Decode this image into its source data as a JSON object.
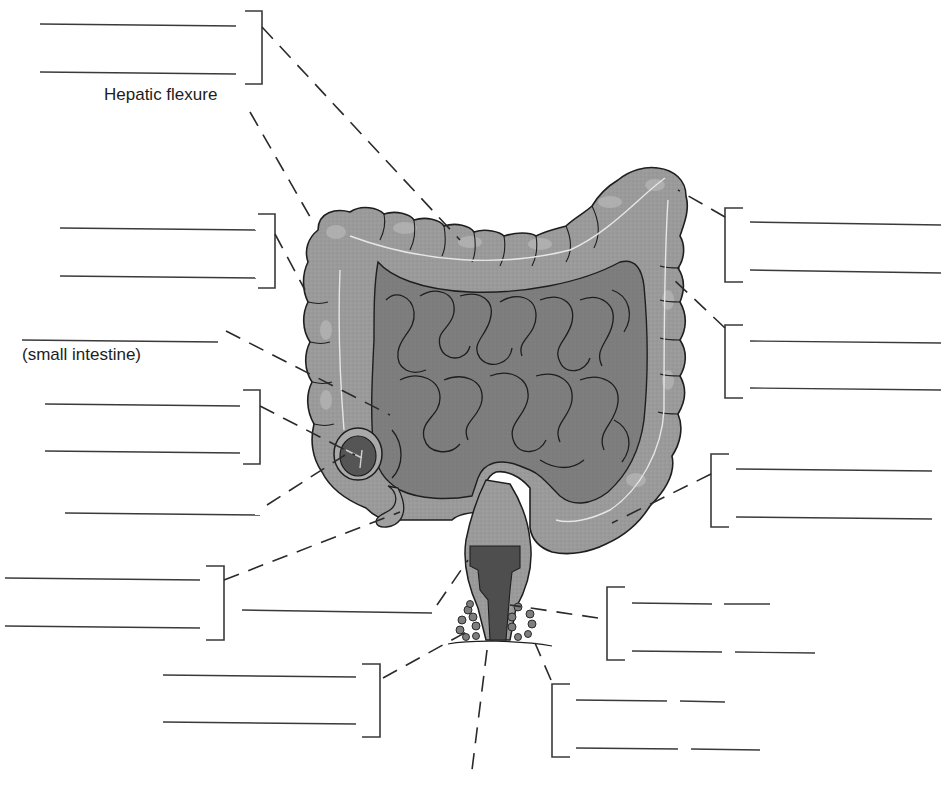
{
  "diagram": {
    "colors": {
      "organ_fill": "#9a9a9a",
      "organ_light": "#b4b4b4",
      "organ_dark": "#7a7a7a",
      "small_intestine_fill": "#8c8c8c",
      "lumen_dark": "#4e4e4e",
      "outline": "#1e1e1e",
      "blank_line": "#3a3a3a",
      "leader_line": "#2a2a2a",
      "taenia_line": "#e6e6e6"
    },
    "printed_labels": [
      {
        "id": "hepatic-flexure",
        "text": "Hepatic flexure",
        "x": 104,
        "y": 95
      },
      {
        "id": "small-intestine",
        "text": "(small intestine)",
        "x": 22,
        "y": 344
      }
    ],
    "blank_groups": [
      {
        "id": "blank-group-transverse-colon",
        "side": "left",
        "lines": [
          [
            40,
            24,
            236,
            26
          ],
          [
            40,
            72,
            236,
            74
          ]
        ],
        "bracket": {
          "x": 262,
          "top": 11,
          "bottom": 84,
          "arm": 17
        },
        "leader": [
          262,
          27,
          460,
          240
        ]
      },
      {
        "id": "blank-group-ascending-colon",
        "side": "left",
        "lines": [
          [
            60,
            228,
            256,
            230
          ],
          [
            60,
            276,
            256,
            278
          ]
        ],
        "bracket": {
          "x": 275,
          "top": 214,
          "bottom": 288,
          "arm": 17
        },
        "leader": [
          275,
          234,
          305,
          290
        ]
      },
      {
        "id": "blank-group-small-intestine",
        "side": "left",
        "lines": [
          [
            22,
            340,
            218,
            342
          ]
        ],
        "bracket": null,
        "leader": [
          226,
          331,
          390,
          415
        ]
      },
      {
        "id": "blank-group-ileocecal",
        "side": "left",
        "lines": [
          [
            45,
            404,
            240,
            406
          ],
          [
            45,
            451,
            240,
            453
          ]
        ],
        "bracket": {
          "x": 260,
          "top": 390,
          "bottom": 464,
          "arm": 17
        },
        "leader": [
          260,
          406,
          355,
          455
        ]
      },
      {
        "id": "blank-group-cecum",
        "side": "left",
        "lines": [
          [
            65,
            513,
            260,
            515
          ]
        ],
        "bracket": null,
        "leader": [
          267,
          505,
          345,
          455
        ]
      },
      {
        "id": "blank-group-appendix",
        "side": "left",
        "lines": [
          [
            5,
            578,
            200,
            580
          ],
          [
            5,
            626,
            200,
            628
          ]
        ],
        "bracket": {
          "x": 224,
          "top": 566,
          "bottom": 640,
          "arm": 18
        },
        "leader": [
          224,
          580,
          400,
          512
        ]
      },
      {
        "id": "blank-group-anal-canal",
        "side": "left",
        "lines": [
          [
            242,
            610,
            432,
            613
          ]
        ],
        "bracket": null,
        "leader": [
          437,
          605,
          468,
          560
        ]
      },
      {
        "id": "blank-group-anus",
        "side": "left",
        "lines": [
          [
            163,
            675,
            356,
            677
          ],
          [
            163,
            722,
            356,
            724
          ]
        ],
        "bracket": {
          "x": 380,
          "top": 664,
          "bottom": 737,
          "arm": 18
        },
        "leader": [
          383,
          678,
          470,
          630
        ]
      },
      {
        "id": "blank-group-splenic-flexure",
        "side": "right",
        "lines": [
          [
            750,
            222,
            941,
            225
          ],
          [
            750,
            270,
            941,
            273
          ]
        ],
        "bracket": {
          "x": 725,
          "top": 208,
          "bottom": 282,
          "arm": 18
        },
        "leader": [
          725,
          217,
          678,
          190
        ]
      },
      {
        "id": "blank-group-descending-colon",
        "side": "right",
        "lines": [
          [
            750,
            341,
            941,
            343
          ],
          [
            750,
            388,
            941,
            390
          ]
        ],
        "bracket": {
          "x": 725,
          "top": 325,
          "bottom": 398,
          "arm": 18
        },
        "leader": [
          725,
          328,
          672,
          278
        ]
      },
      {
        "id": "blank-group-sigmoid-colon",
        "side": "right",
        "lines": [
          [
            736,
            469,
            932,
            471
          ],
          [
            736,
            517,
            932,
            519
          ]
        ],
        "bracket": {
          "x": 711,
          "top": 454,
          "bottom": 527,
          "arm": 18
        },
        "leader": [
          711,
          474,
          612,
          523
        ]
      },
      {
        "id": "blank-group-sphincter-internal",
        "side": "right",
        "lines": [
          [
            632,
            603,
            712,
            604
          ],
          [
            724,
            604,
            770,
            604
          ],
          [
            632,
            651,
            722,
            652
          ],
          [
            735,
            652,
            815,
            653
          ]
        ],
        "bracket": {
          "x": 607,
          "top": 587,
          "bottom": 660,
          "arm": 18
        },
        "leader": [
          598,
          618,
          510,
          605
        ]
      },
      {
        "id": "blank-group-sphincter-external",
        "side": "right",
        "lines": [
          [
            576,
            700,
            667,
            701
          ],
          [
            680,
            701,
            725,
            702
          ],
          [
            576,
            748,
            678,
            749
          ],
          [
            691,
            749,
            760,
            750
          ]
        ],
        "bracket": {
          "x": 552,
          "top": 684,
          "bottom": 757,
          "arm": 18
        },
        "leader": [
          551,
          680,
          535,
          643
        ]
      },
      {
        "id": "blank-group-bottom",
        "side": "bottom",
        "lines": [],
        "bracket": null,
        "leader": [
          487,
          650,
          472,
          770
        ]
      }
    ],
    "hepatic_leader": [
      250,
      112,
      313,
      222
    ]
  }
}
